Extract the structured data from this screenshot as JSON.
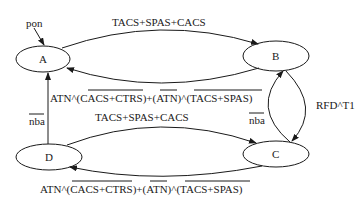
{
  "diagram": {
    "type": "state-transition",
    "nodes": [
      {
        "id": "A",
        "label": "A",
        "cx": 43,
        "cy": 59,
        "rx": 27,
        "ry": 13
      },
      {
        "id": "B",
        "label": "B",
        "cx": 276,
        "cy": 56,
        "rx": 33,
        "ry": 15
      },
      {
        "id": "C",
        "label": "C",
        "cx": 276,
        "cy": 154,
        "rx": 33,
        "ry": 13
      },
      {
        "id": "D",
        "label": "D",
        "cx": 49,
        "cy": 157,
        "rx": 33,
        "ry": 13
      }
    ],
    "edges": [
      {
        "from": "A",
        "to": "B",
        "label": "TACS+SPAS+CACS"
      },
      {
        "from": "B",
        "to": "A",
        "label_parts": [
          "ATN^(",
          "CACS+CTRS)",
          "+(",
          "ATN",
          ")^(",
          "TACS+SPAS)"
        ]
      },
      {
        "from": "D",
        "to": "A",
        "label": "nba",
        "label_overline": true
      },
      {
        "from": "D",
        "to": "C",
        "label": "TACS+SPAS+CACS"
      },
      {
        "from": "C",
        "to": "D",
        "label_parts": [
          "ATN^(",
          "CACS+CTRS)",
          "+(",
          "ATN",
          ")^(",
          "TACS+SPAS)"
        ]
      },
      {
        "from": "B",
        "to": "C",
        "label": "RFD^T1"
      },
      {
        "from": "C",
        "to": "B",
        "label": "nba",
        "label_overline": true
      }
    ],
    "entry": {
      "label": "pon",
      "target": "A"
    }
  },
  "labels": {
    "pon": "pon",
    "ab": "TACS+SPAS+CACS",
    "dc": "TACS+SPAS+CACS",
    "nba_left": "nba",
    "nba_right": "nba",
    "rfd": "RFD^T1",
    "ba": {
      "p1": "ATN^(",
      "p2": "CACS+CTRS)",
      "p3": "+(",
      "p4": "ATN",
      "p5": ")^(",
      "p6": "TACS+SPAS)"
    },
    "cd": {
      "p1": "ATN^(",
      "p2": "CACS+CTRS)",
      "p3": "+(",
      "p4": "ATN",
      "p5": ")^(",
      "p6": "TACS+SPAS)"
    },
    "node_a": "A",
    "node_b": "B",
    "node_c": "C",
    "node_d": "D"
  }
}
